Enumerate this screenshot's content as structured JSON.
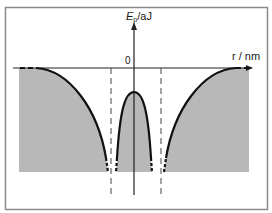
{
  "figure": {
    "type": "potential-energy-diagram",
    "y_axis": {
      "label_main": "E",
      "label_sub": "p",
      "label_unit": "/aJ"
    },
    "x_axis": {
      "label": "r / nm"
    },
    "origin_label": "0",
    "colors": {
      "frame": "#8a8a8a",
      "shade": "#b8b8b8",
      "curve": "#111111",
      "axis": "#222222",
      "dashed": "#444444",
      "background": "#ffffff"
    }
  }
}
